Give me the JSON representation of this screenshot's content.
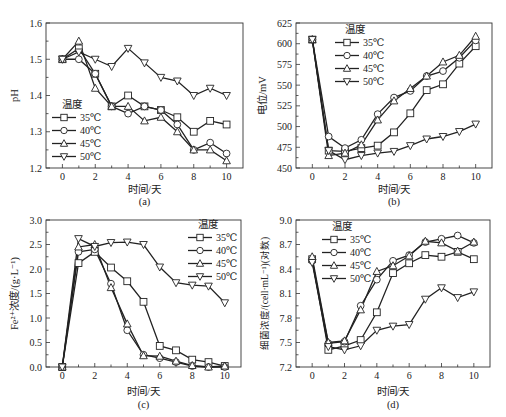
{
  "figure": {
    "legend_title": "温度",
    "series_names": [
      "35℃",
      "40℃",
      "45℃",
      "50℃"
    ],
    "markers": [
      "square",
      "circle",
      "triangle-up",
      "triangle-down"
    ]
  },
  "chart_data": [
    {
      "id": "a",
      "type": "line",
      "caption": "(a)",
      "title": "",
      "xlabel": "时间/天",
      "ylabel": "pH",
      "xlim": [
        -1,
        11
      ],
      "ylim": [
        1.2,
        1.6
      ],
      "xticks": [
        0,
        2,
        4,
        6,
        8,
        10
      ],
      "yticks": [
        1.2,
        1.3,
        1.4,
        1.5,
        1.6
      ],
      "ytick_labels": [
        "1.2",
        "1.3",
        "1.4",
        "1.5",
        "1.6"
      ],
      "grid": false,
      "legend_title": "温度",
      "legend_position": "lower-left",
      "x": [
        0,
        1,
        2,
        3,
        4,
        5,
        6,
        7,
        8,
        9,
        10
      ],
      "series": [
        {
          "name": "35℃",
          "marker": "square",
          "values": [
            1.5,
            1.53,
            1.46,
            1.37,
            1.4,
            1.37,
            1.36,
            1.34,
            1.3,
            1.33,
            1.32
          ]
        },
        {
          "name": "40℃",
          "marker": "circle",
          "values": [
            1.5,
            1.5,
            1.46,
            1.37,
            1.35,
            1.37,
            1.36,
            1.32,
            1.25,
            1.27,
            1.24
          ]
        },
        {
          "name": "45℃",
          "marker": "triangle-up",
          "values": [
            1.5,
            1.55,
            1.42,
            1.37,
            1.37,
            1.33,
            1.34,
            1.3,
            1.25,
            1.25,
            1.22
          ]
        },
        {
          "name": "50℃",
          "marker": "triangle-down",
          "values": [
            1.5,
            1.52,
            1.5,
            1.48,
            1.53,
            1.49,
            1.45,
            1.44,
            1.4,
            1.42,
            1.4
          ]
        }
      ]
    },
    {
      "id": "b",
      "type": "line",
      "caption": "(b)",
      "title": "",
      "xlabel": "时间/天",
      "ylabel": "电位/mV",
      "xlim": [
        -1,
        11
      ],
      "ylim": [
        450,
        625
      ],
      "xticks": [
        0,
        2,
        4,
        6,
        8,
        10
      ],
      "yticks": [
        450,
        475,
        500,
        525,
        550,
        575,
        600,
        625
      ],
      "ytick_labels": [
        "450",
        "475",
        "500",
        "525",
        "550",
        "575",
        "600",
        "625"
      ],
      "grid": false,
      "legend_title": "温度",
      "legend_position": "upper-left",
      "x": [
        0,
        1,
        2,
        3,
        4,
        5,
        6,
        7,
        8,
        9,
        10
      ],
      "series": [
        {
          "name": "35℃",
          "marker": "square",
          "values": [
            605,
            471,
            470,
            474,
            477,
            493,
            516,
            544,
            551,
            576,
            597
          ]
        },
        {
          "name": "40℃",
          "marker": "circle",
          "values": [
            605,
            488,
            474,
            484,
            515,
            535,
            543,
            561,
            567,
            583,
            604
          ]
        },
        {
          "name": "45℃",
          "marker": "triangle-up",
          "values": [
            605,
            465,
            468,
            478,
            508,
            531,
            546,
            561,
            578,
            586,
            609
          ]
        },
        {
          "name": "50℃",
          "marker": "triangle-down",
          "values": [
            605,
            471,
            460,
            465,
            468,
            470,
            477,
            485,
            488,
            494,
            503
          ]
        }
      ]
    },
    {
      "id": "c",
      "type": "line",
      "caption": "(c)",
      "title": "",
      "xlabel": "时间/天",
      "ylabel": "Fe²⁺浓度/(g·L⁻¹)",
      "xlim": [
        -1,
        11
      ],
      "ylim": [
        0.0,
        3.0
      ],
      "xticks": [
        0,
        2,
        4,
        6,
        8,
        10
      ],
      "yticks": [
        0.0,
        0.5,
        1.0,
        1.5,
        2.0,
        2.5,
        3.0
      ],
      "ytick_labels": [
        "0.0",
        "0.5",
        "1.0",
        "1.5",
        "2.0",
        "2.5",
        "3.0"
      ],
      "grid": false,
      "legend_title": "温度",
      "legend_position": "upper-right",
      "x": [
        0,
        1,
        2,
        3,
        4,
        5,
        6,
        7,
        8,
        9,
        10
      ],
      "series": [
        {
          "name": "35℃",
          "marker": "square",
          "values": [
            0.0,
            2.12,
            2.35,
            2.03,
            1.75,
            1.33,
            0.43,
            0.34,
            0.15,
            0.1,
            0.02
          ]
        },
        {
          "name": "40℃",
          "marker": "circle",
          "values": [
            0.0,
            2.35,
            2.4,
            1.7,
            0.75,
            0.25,
            0.18,
            0.1,
            0.02,
            0.0,
            0.0
          ]
        },
        {
          "name": "45℃",
          "marker": "triangle-up",
          "values": [
            0.0,
            2.45,
            2.5,
            1.62,
            0.88,
            0.23,
            0.22,
            0.12,
            0.03,
            0.0,
            0.02
          ]
        },
        {
          "name": "50℃",
          "marker": "triangle-down",
          "values": [
            0.0,
            2.62,
            2.46,
            2.54,
            2.55,
            2.5,
            2.04,
            1.72,
            1.67,
            1.65,
            1.31
          ]
        }
      ]
    },
    {
      "id": "d",
      "type": "line",
      "caption": "(d)",
      "title": "",
      "xlabel": "时间/天",
      "ylabel": "细菌浓度/(cell·mL⁻¹)(对数)",
      "xlim": [
        -1,
        11
      ],
      "ylim": [
        7.2,
        9.0
      ],
      "xticks": [
        0,
        2,
        4,
        6,
        8,
        10
      ],
      "yticks": [
        7.2,
        7.5,
        7.8,
        8.1,
        8.4,
        8.7,
        9.0
      ],
      "ytick_labels": [
        "7.2",
        "7.5",
        "7.8",
        "8.1",
        "8.4",
        "8.7",
        "9.0"
      ],
      "grid": false,
      "legend_title": "温度",
      "legend_position": "upper-left",
      "x": [
        0,
        1,
        2,
        3,
        4,
        5,
        6,
        7,
        8,
        9,
        10
      ],
      "series": [
        {
          "name": "35℃",
          "marker": "square",
          "values": [
            8.52,
            7.41,
            7.46,
            7.53,
            7.87,
            8.35,
            8.47,
            8.57,
            8.55,
            8.61,
            8.52
          ]
        },
        {
          "name": "40℃",
          "marker": "circle",
          "values": [
            8.5,
            7.49,
            7.51,
            7.95,
            8.27,
            8.5,
            8.57,
            8.73,
            8.77,
            8.81,
            8.72
          ]
        },
        {
          "name": "45℃",
          "marker": "triangle-up",
          "values": [
            8.55,
            7.5,
            7.52,
            7.9,
            8.37,
            8.44,
            8.56,
            8.74,
            8.72,
            8.62,
            8.73
          ]
        },
        {
          "name": "50℃",
          "marker": "triangle-down",
          "values": [
            8.48,
            7.45,
            7.41,
            7.46,
            7.65,
            7.7,
            7.72,
            8.03,
            8.17,
            8.05,
            8.12
          ]
        }
      ]
    }
  ]
}
